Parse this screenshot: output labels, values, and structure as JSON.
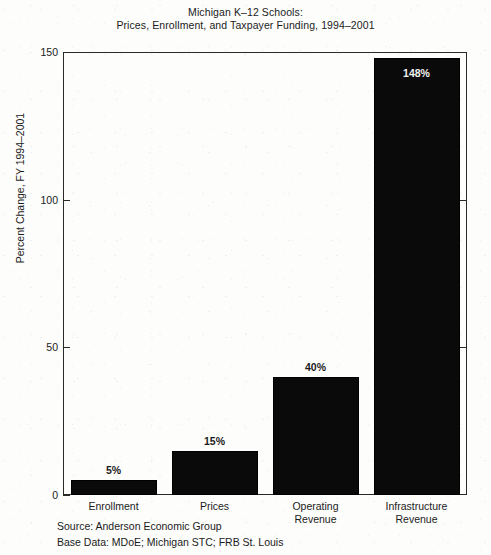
{
  "chart_data": {
    "type": "bar",
    "title": "Michigan K–12 Schools:\nPrices, Enrollment, and Taxpayer Funding, 1994–2001",
    "title_lines": [
      "Michigan K–12 Schools:",
      "Prices, Enrollment, and Taxpayer Funding, 1994–2001"
    ],
    "categories": [
      "Enrollment",
      "Prices",
      "Operating Revenue",
      "Infrastructure Revenue"
    ],
    "category_lines": [
      [
        "Enrollment"
      ],
      [
        "Prices"
      ],
      [
        "Operating",
        "Revenue"
      ],
      [
        "Infrastructure",
        "Revenue"
      ]
    ],
    "values": [
      5,
      15,
      40,
      148
    ],
    "value_labels": [
      "5%",
      "15%",
      "40%",
      "148%"
    ],
    "label_placement": [
      "above",
      "above",
      "above",
      "inside"
    ],
    "xlabel": "",
    "ylabel": "Percent Change, FY 1994–2001",
    "ylim": [
      0,
      150
    ],
    "yticks": [
      0,
      50,
      100,
      150
    ],
    "ytick_labels": [
      "0",
      "50",
      "100",
      "150"
    ],
    "grid": false,
    "legend": false,
    "bar_color": "#0a0a0a",
    "axis_color": "#2a2a2a",
    "background_color": "#fdfdfc",
    "inside_label_color": "#f2f2f2"
  },
  "footnotes": {
    "source": "Source: Anderson Economic Group",
    "base_data": "Base Data: MDoE; Michigan STC; FRB St. Louis"
  }
}
